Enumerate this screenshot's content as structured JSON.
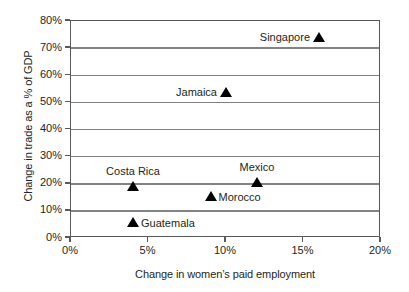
{
  "chart_data": {
    "type": "scatter",
    "title": "",
    "xlabel": "Change in women’s paid employment",
    "ylabel": "Change in trade as a % of GDP",
    "xlim": [
      0,
      20
    ],
    "ylim": [
      0,
      80
    ],
    "x_ticks": [
      "0%",
      "5%",
      "10%",
      "15%",
      "20%"
    ],
    "x_tick_values": [
      0,
      5,
      10,
      15,
      20
    ],
    "y_ticks": [
      "0%",
      "10%",
      "20%",
      "30%",
      "40%",
      "50%",
      "60%",
      "70%",
      "80%"
    ],
    "y_tick_values": [
      0,
      10,
      20,
      30,
      40,
      50,
      60,
      70,
      80
    ],
    "grid": true,
    "legend": "none",
    "marker": "triangle-up",
    "marker_color": "#000000",
    "gridline_color": "#808285",
    "border_color": "#58595b",
    "background_color": "#ffffff",
    "points": [
      {
        "label": "Singapore",
        "x": 16,
        "y": 74,
        "label_position": "left"
      },
      {
        "label": "Jamaica",
        "x": 10,
        "y": 54,
        "label_position": "left"
      },
      {
        "label": "Mexico",
        "x": 12,
        "y": 20.5,
        "label_position": "above"
      },
      {
        "label": "Costa Rica",
        "x": 4,
        "y": 19,
        "label_position": "above"
      },
      {
        "label": "Morocco",
        "x": 9,
        "y": 15.5,
        "label_position": "right"
      },
      {
        "label": "Guatemala",
        "x": 4,
        "y": 6,
        "label_position": "right"
      }
    ]
  }
}
